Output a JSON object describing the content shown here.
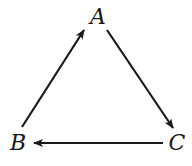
{
  "diagram": {
    "type": "directed-cycle",
    "nodes": [
      {
        "id": "A",
        "label": "A",
        "x": 98,
        "y": 17
      },
      {
        "id": "B",
        "label": "B",
        "x": 18,
        "y": 143
      },
      {
        "id": "C",
        "label": "C",
        "x": 177,
        "y": 143
      }
    ],
    "edges": [
      {
        "from": "B",
        "to": "A",
        "x1": 22,
        "y1": 127,
        "x2": 84,
        "y2": 30
      },
      {
        "from": "A",
        "to": "C",
        "x1": 107,
        "y1": 30,
        "x2": 173,
        "y2": 128
      },
      {
        "from": "C",
        "to": "B",
        "x1": 163,
        "y1": 143,
        "x2": 34,
        "y2": 143
      }
    ],
    "colors": {
      "stroke": "#1a1a1a",
      "background": "#ffffff"
    }
  }
}
